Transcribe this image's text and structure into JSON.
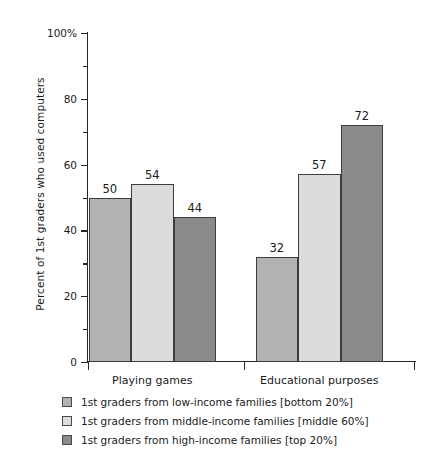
{
  "chart_data": {
    "type": "bar",
    "title": "",
    "xlabel": "",
    "ylabel": "Percent of 1st graders who used computers",
    "ylim": [
      0,
      100
    ],
    "ytick_labels": [
      "0",
      "20",
      "40",
      "60",
      "80",
      "100%"
    ],
    "ytick_values": [
      0,
      20,
      40,
      60,
      80,
      100
    ],
    "yminor_values": [
      10,
      30,
      50,
      70,
      90
    ],
    "grid": false,
    "legend_position": "below",
    "categories": [
      "Playing games",
      "Educational purposes"
    ],
    "series": [
      {
        "name": "1st graders from low-income families [bottom 20%]",
        "color": "#b2b2b2",
        "values": [
          50,
          32
        ]
      },
      {
        "name": "1st graders from middle-income families [middle 60%]",
        "color": "#dcdcdc",
        "values": [
          54,
          57
        ]
      },
      {
        "name": "1st graders from high-income families [top 20%]",
        "color": "#8a8a8a",
        "values": [
          44,
          72
        ]
      }
    ]
  }
}
